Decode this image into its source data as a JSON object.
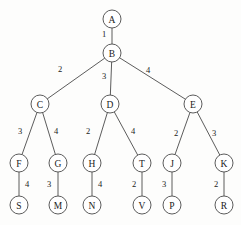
{
  "diagram": {
    "type": "weighted-tree",
    "title": "",
    "style": {
      "stroke_color": "#4a4a4a",
      "node_fill": "#ffffff",
      "text_color": "#1a1a1a",
      "background": "#fdfdfc",
      "node_radius": 9
    },
    "nodes": [
      {
        "id": "A",
        "label": "A",
        "x": 112,
        "y": 19,
        "depth": 0
      },
      {
        "id": "B",
        "label": "B",
        "x": 112,
        "y": 53,
        "depth": 1
      },
      {
        "id": "C",
        "label": "C",
        "x": 40,
        "y": 104,
        "depth": 2
      },
      {
        "id": "D",
        "label": "D",
        "x": 110,
        "y": 104,
        "depth": 2
      },
      {
        "id": "E",
        "label": "E",
        "x": 193,
        "y": 104,
        "depth": 2
      },
      {
        "id": "F",
        "label": "F",
        "x": 19,
        "y": 163,
        "depth": 3
      },
      {
        "id": "G",
        "label": "G",
        "x": 58,
        "y": 163,
        "depth": 3
      },
      {
        "id": "H",
        "label": "H",
        "x": 92,
        "y": 163,
        "depth": 3
      },
      {
        "id": "T",
        "label": "T",
        "x": 142,
        "y": 163,
        "depth": 3
      },
      {
        "id": "J",
        "label": "J",
        "x": 172,
        "y": 163,
        "depth": 3
      },
      {
        "id": "K",
        "label": "K",
        "x": 224,
        "y": 163,
        "depth": 3
      },
      {
        "id": "S",
        "label": "S",
        "x": 19,
        "y": 205,
        "depth": 4
      },
      {
        "id": "M",
        "label": "M",
        "x": 58,
        "y": 205,
        "depth": 4
      },
      {
        "id": "N",
        "label": "N",
        "x": 92,
        "y": 205,
        "depth": 4
      },
      {
        "id": "V",
        "label": "V",
        "x": 142,
        "y": 205,
        "depth": 4
      },
      {
        "id": "P",
        "label": "P",
        "x": 172,
        "y": 205,
        "depth": 4
      },
      {
        "id": "R",
        "label": "R",
        "x": 224,
        "y": 205,
        "depth": 4
      }
    ],
    "edges": [
      {
        "from": "A",
        "to": "B",
        "weight": "1",
        "lx": 104,
        "ly": 34
      },
      {
        "from": "B",
        "to": "C",
        "weight": "2",
        "lx": 60,
        "ly": 69
      },
      {
        "from": "B",
        "to": "D",
        "weight": "3",
        "lx": 104,
        "ly": 76
      },
      {
        "from": "B",
        "to": "E",
        "weight": "4",
        "lx": 148,
        "ly": 70
      },
      {
        "from": "C",
        "to": "F",
        "weight": "3",
        "lx": 20,
        "ly": 131
      },
      {
        "from": "C",
        "to": "G",
        "weight": "4",
        "lx": 56,
        "ly": 131
      },
      {
        "from": "D",
        "to": "H",
        "weight": "2",
        "lx": 88,
        "ly": 131
      },
      {
        "from": "D",
        "to": "T",
        "weight": "4",
        "lx": 133,
        "ly": 131
      },
      {
        "from": "E",
        "to": "J",
        "weight": "2",
        "lx": 176,
        "ly": 133
      },
      {
        "from": "E",
        "to": "K",
        "weight": "3",
        "lx": 214,
        "ly": 133
      },
      {
        "from": "F",
        "to": "S",
        "weight": "4",
        "lx": 27,
        "ly": 184
      },
      {
        "from": "G",
        "to": "M",
        "weight": "3",
        "lx": 49,
        "ly": 184
      },
      {
        "from": "H",
        "to": "N",
        "weight": "4",
        "lx": 100,
        "ly": 184
      },
      {
        "from": "T",
        "to": "V",
        "weight": "2",
        "lx": 134,
        "ly": 184
      },
      {
        "from": "J",
        "to": "P",
        "weight": "3",
        "lx": 164,
        "ly": 184
      },
      {
        "from": "K",
        "to": "R",
        "weight": "2",
        "lx": 216,
        "ly": 184
      }
    ]
  }
}
